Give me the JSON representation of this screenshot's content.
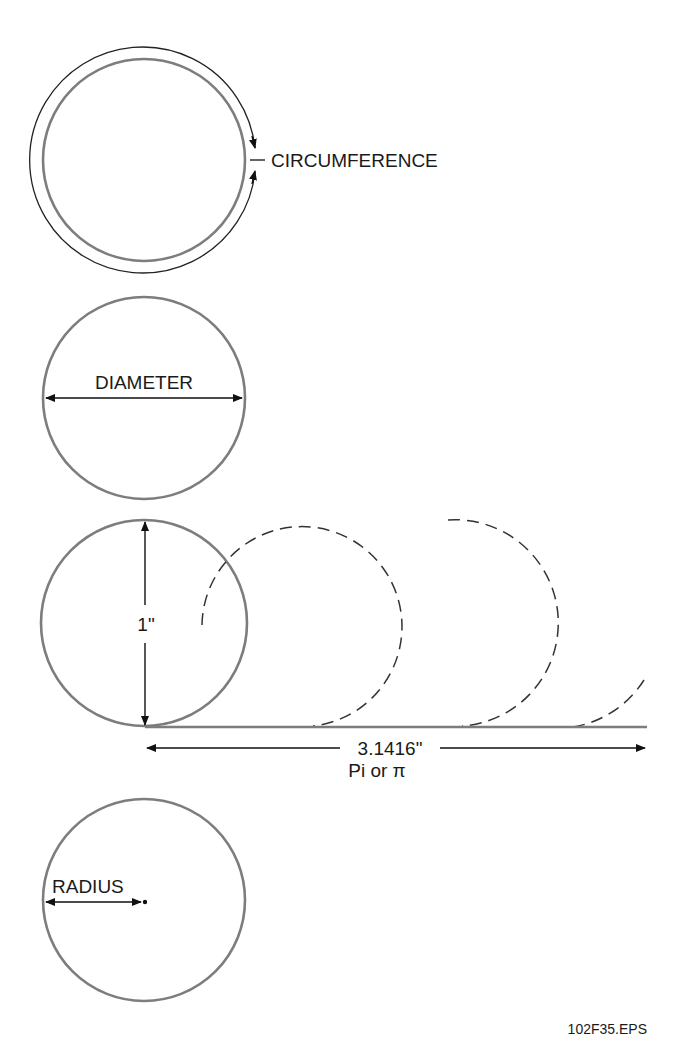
{
  "figure": {
    "circumference_panel": {
      "label": "CIRCUMFERENCE"
    },
    "diameter_panel": {
      "label": "DIAMETER"
    },
    "pi_panel": {
      "diameter_label": "1\"",
      "length_label": "3.1416\"",
      "pi_label": "Pi or π"
    },
    "radius_panel": {
      "label": "RADIUS"
    },
    "file_id": "102F35.EPS"
  },
  "colors": {
    "circle_stroke": "#7d7d7d",
    "line_ink": "#111111",
    "background": "#ffffff"
  }
}
